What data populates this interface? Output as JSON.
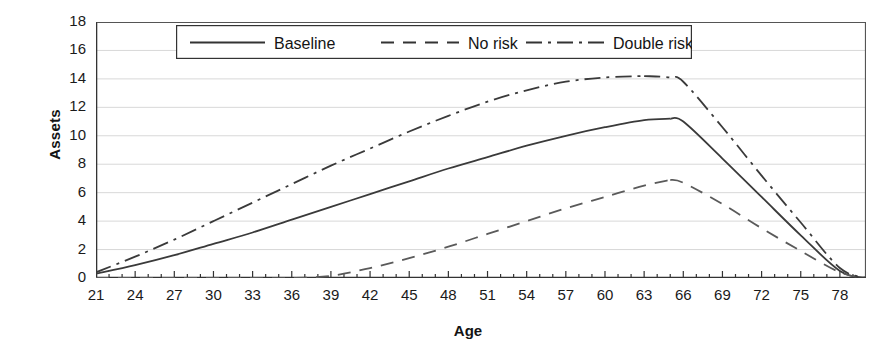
{
  "chart_data": {
    "type": "line",
    "title": "",
    "xlabel": "Age",
    "ylabel": "Assets",
    "xlim": [
      21,
      80
    ],
    "ylim": [
      0,
      18
    ],
    "ytick_step": 2,
    "xtick_step": 3,
    "minor_xticks": 1,
    "grid": "horizontal",
    "legend_position": "top-center",
    "xticks": [
      21,
      24,
      27,
      30,
      33,
      36,
      39,
      42,
      45,
      48,
      51,
      54,
      57,
      60,
      63,
      66,
      69,
      72,
      75,
      78
    ],
    "yticks": [
      0,
      2,
      4,
      6,
      8,
      10,
      12,
      14,
      16,
      18
    ],
    "x": [
      21,
      24,
      27,
      30,
      33,
      36,
      39,
      42,
      45,
      48,
      51,
      54,
      57,
      60,
      63,
      65,
      66,
      69,
      72,
      75,
      78,
      80
    ],
    "series": [
      {
        "name": "Baseline",
        "style": "solid",
        "color": "#3a3a3a",
        "values": [
          0.3,
          0.9,
          1.6,
          2.4,
          3.2,
          4.1,
          5.0,
          5.9,
          6.8,
          7.7,
          8.5,
          9.3,
          10.0,
          10.6,
          11.1,
          11.2,
          11.0,
          8.4,
          5.7,
          3.0,
          0.5,
          0.0
        ]
      },
      {
        "name": "No risk",
        "style": "dashed",
        "color": "#5a5a5a",
        "values": [
          0.0,
          0.0,
          0.0,
          0.0,
          0.0,
          0.0,
          0.15,
          0.7,
          1.4,
          2.2,
          3.1,
          4.0,
          4.9,
          5.7,
          6.5,
          6.9,
          6.7,
          5.2,
          3.5,
          1.9,
          0.4,
          0.0
        ]
      },
      {
        "name": "Double risk",
        "style": "dashdot",
        "color": "#3a3a3a",
        "values": [
          0.4,
          1.5,
          2.7,
          4.0,
          5.3,
          6.6,
          7.9,
          9.1,
          10.3,
          11.4,
          12.4,
          13.2,
          13.8,
          14.1,
          14.2,
          14.1,
          13.8,
          10.6,
          7.2,
          3.9,
          0.7,
          0.0
        ]
      }
    ],
    "legend": [
      {
        "label": "Baseline",
        "style": "solid"
      },
      {
        "label": "No risk",
        "style": "dashed"
      },
      {
        "label": "Double risk",
        "style": "dashdot"
      }
    ]
  }
}
